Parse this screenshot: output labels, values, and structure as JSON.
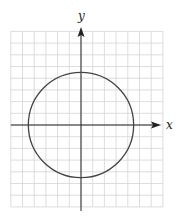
{
  "chart_data": {
    "type": "line",
    "title": "",
    "xlabel": "x",
    "ylabel": "y",
    "grid": true,
    "xlim": [
      -6,
      7
    ],
    "ylim": [
      -7,
      8
    ],
    "tick_labels": false,
    "series": [
      {
        "name": "circle",
        "shape": "circle",
        "center": [
          0,
          0
        ],
        "radius": 4.5,
        "color": "#444444"
      }
    ]
  },
  "colors": {
    "grid": "#d4d4d4",
    "axis": "#222222",
    "curve": "#444444"
  }
}
